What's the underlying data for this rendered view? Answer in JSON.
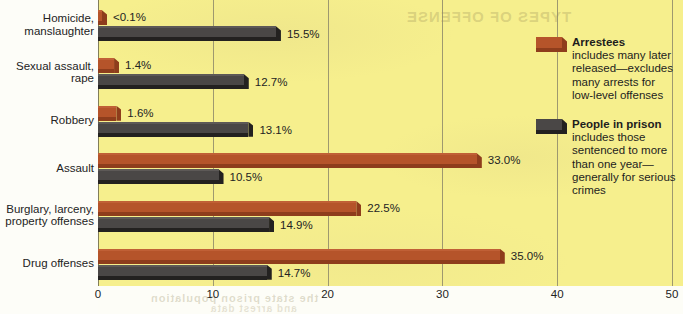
{
  "chart_data": {
    "type": "bar",
    "orientation": "horizontal",
    "title": "",
    "subtitle": "",
    "xlabel": "",
    "ylabel": "",
    "xlim": [
      0,
      50
    ],
    "xticks": [
      0,
      10,
      20,
      30,
      40,
      50
    ],
    "xtick_labels": [
      "0",
      "10",
      "20",
      "30",
      "40",
      "50"
    ],
    "grid": true,
    "grid_axis": "x",
    "legend_position": "right",
    "value_unit": "%",
    "categories": [
      "Homicide,\nmanslaughter",
      "Sexual assault,\nrape",
      "Robbery",
      "Assault",
      "Burglary, larceny,\nproperty offenses",
      "Drug offenses"
    ],
    "series": [
      {
        "name": "Arrestees",
        "color": "#b5542a",
        "values": [
          0.05,
          1.4,
          1.6,
          33.0,
          22.5,
          35.0
        ],
        "value_labels": [
          "<0.1%",
          "1.4%",
          "1.6%",
          "33.0%",
          "22.5%",
          "35.0%"
        ]
      },
      {
        "name": "People in prison",
        "color": "#4a4746",
        "values": [
          15.5,
          12.7,
          13.1,
          10.5,
          14.9,
          14.7
        ],
        "value_labels": [
          "15.5%",
          "12.7%",
          "13.1%",
          "10.5%",
          "14.9%",
          "14.7%"
        ]
      }
    ]
  },
  "legend": {
    "entries": [
      {
        "swatch": "arrestee",
        "title": "Arrestees",
        "description": "includes many later released—excludes many arrests for low-level offenses"
      },
      {
        "swatch": "prison",
        "title": "People in prison",
        "description": "includes those sentenced to more than one year—generally for serious crimes"
      }
    ]
  },
  "artifacts": {
    "bleed_top": "TYPES OF OFFENSE",
    "bleed_bottom": "the state prison population",
    "bleed_bottom2": "and arrest data"
  },
  "colors": {
    "plot_background": "#f6ef8d",
    "gutter_background": "#fdfdf8",
    "gridline": "#8e8a6a",
    "arrestee_bar": "#b5542a",
    "arrestee_shadow": "#8e3d1c",
    "prison_bar": "#4a4746",
    "prison_shadow": "#232120",
    "text": "#232323"
  }
}
